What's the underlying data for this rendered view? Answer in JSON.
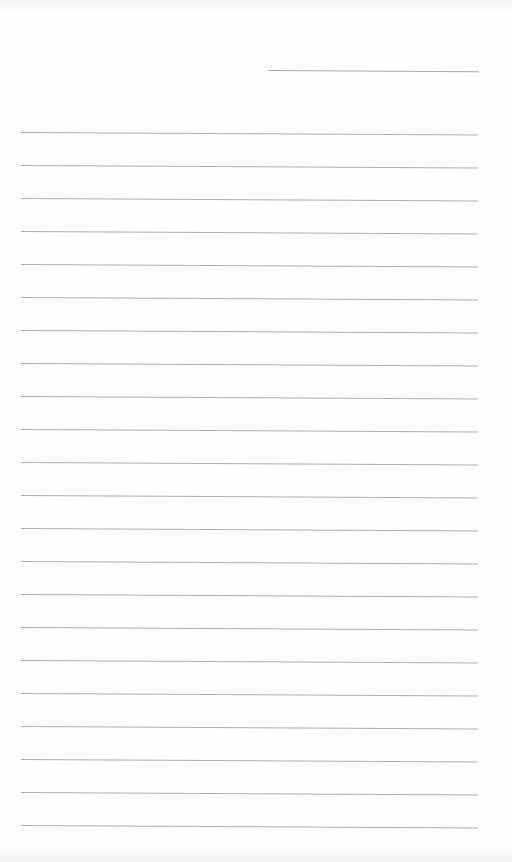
{
  "page": {
    "type": "lined-paper",
    "background_color": "#fefefe",
    "line_color": "#b0b0b0",
    "header_line": {
      "label": "name-or-date-line"
    },
    "ruled_line_count": 22,
    "line_spacing_px": 33,
    "text_content": ""
  }
}
